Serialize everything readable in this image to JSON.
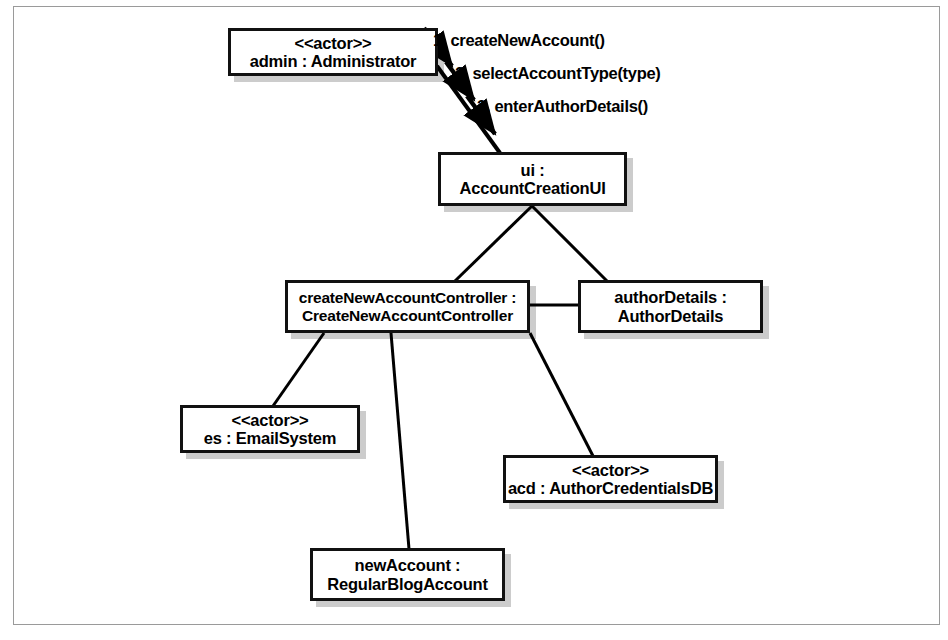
{
  "diagram": {
    "kind": "uml-communication-diagram",
    "title": "",
    "frame": {
      "border_color": "#9a9a9a",
      "background": "#ffffff"
    },
    "style": {
      "node_border_color": "#111111",
      "node_fill": "#ffffff",
      "edge_color": "#000000",
      "shadow_color": "rgba(0,0,0,0.20)"
    },
    "nodes": [
      {
        "id": "admin",
        "stereotype": "<<actor>>",
        "label": "admin : Administrator",
        "x": 228,
        "y": 28,
        "w": 210,
        "h": 48,
        "font_size": 16.5
      },
      {
        "id": "ui",
        "stereotype": "",
        "line1": "ui :",
        "line2": "AccountCreationUI",
        "x": 438,
        "y": 152,
        "w": 189,
        "h": 54,
        "font_size": 16.5
      },
      {
        "id": "createNewAccountController",
        "stereotype": "",
        "line1": "createNewAccountController :",
        "line2": "CreateNewAccountController",
        "x": 285,
        "y": 280,
        "w": 245,
        "h": 53,
        "font_size": 15.5
      },
      {
        "id": "authorDetails",
        "stereotype": "",
        "line1": "authorDetails :",
        "line2": "AuthorDetails",
        "x": 578,
        "y": 280,
        "w": 185,
        "h": 53,
        "font_size": 16.5
      },
      {
        "id": "es",
        "stereotype": "<<actor>>",
        "label": "es : EmailSystem",
        "x": 180,
        "y": 405,
        "w": 180,
        "h": 48,
        "font_size": 16.5
      },
      {
        "id": "acd",
        "stereotype": "<<actor>>",
        "label": "acd : AuthorCredentialsDB",
        "x": 503,
        "y": 455,
        "w": 215,
        "h": 48,
        "font_size": 16.5
      },
      {
        "id": "newAccount",
        "stereotype": "",
        "line1": "newAccount :",
        "line2": "RegularBlogAccount",
        "x": 310,
        "y": 548,
        "w": 195,
        "h": 53,
        "font_size": 16.5
      }
    ],
    "links": [
      {
        "id": "admin-ui",
        "from": "admin",
        "to": "ui",
        "x1": 437,
        "y1": 66,
        "x2": 500,
        "y2": 153
      },
      {
        "id": "ui-controller",
        "from": "ui",
        "to": "createNewAccountController",
        "x1": 532,
        "y1": 206,
        "x2": 455,
        "y2": 281
      },
      {
        "id": "ui-authorDetails",
        "from": "ui",
        "to": "authorDetails",
        "x1": 532,
        "y1": 206,
        "x2": 607,
        "y2": 281
      },
      {
        "id": "controller-authorDetails",
        "from": "createNewAccountController",
        "to": "authorDetails",
        "x1": 530,
        "y1": 306,
        "x2": 578,
        "y2": 306
      },
      {
        "id": "controller-es",
        "from": "createNewAccountController",
        "to": "es",
        "x1": 323,
        "y1": 333,
        "x2": 273,
        "y2": 405
      },
      {
        "id": "controller-newAccount",
        "from": "createNewAccountController",
        "to": "newAccount",
        "x1": 391,
        "y1": 333,
        "x2": 408,
        "y2": 548
      },
      {
        "id": "controller-acd",
        "from": "createNewAccountController",
        "to": "acd",
        "x1": 530,
        "y1": 333,
        "x2": 592,
        "y2": 455
      }
    ],
    "messages": [
      {
        "id": "msg-1",
        "sequence": "1.",
        "text": "createNewAccount()",
        "label": "1. createNewAccount()",
        "label_x": 433,
        "label_y": 31,
        "arrow": {
          "x1": 424,
          "y1": 28,
          "x2": 457,
          "y2": 72
        }
      },
      {
        "id": "msg-2",
        "sequence": "2.",
        "text": "selectAccountType(type)",
        "label": "2. selectAccountType(type)",
        "label_x": 456,
        "label_y": 64,
        "arrow": {
          "x1": 445,
          "y1": 62,
          "x2": 478,
          "y2": 106
        }
      },
      {
        "id": "msg-3",
        "sequence": "3.",
        "text": "enterAuthorDetails()",
        "label": "3. enterAuthorDetails()",
        "label_x": 477,
        "label_y": 97,
        "arrow": {
          "x1": 466,
          "y1": 95,
          "x2": 499,
          "y2": 139
        }
      }
    ]
  }
}
